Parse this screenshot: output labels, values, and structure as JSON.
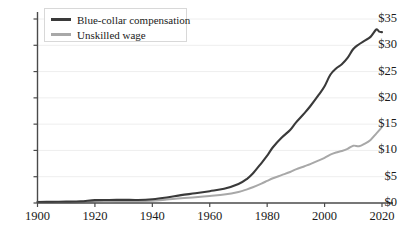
{
  "chart_data": {
    "type": "line",
    "title": "",
    "subtitle": "",
    "xlabel": "",
    "ylabel": "",
    "xlim": [
      1900,
      2020
    ],
    "ylim": [
      0,
      35
    ],
    "grid": true,
    "legend_position": "top-left",
    "x_ticks": [
      "1900",
      "1920",
      "1940",
      "1960",
      "1980",
      "2000",
      "2020"
    ],
    "x_tick_values": [
      1900,
      1920,
      1940,
      1960,
      1980,
      2000,
      2020
    ],
    "y_ticks": [
      "$0",
      "$5",
      "$10",
      "$15",
      "$20",
      "$25",
      "$30",
      "$35"
    ],
    "y_tick_values": [
      0,
      5,
      10,
      15,
      20,
      25,
      30,
      35
    ],
    "x": [
      1900,
      1905,
      1910,
      1915,
      1920,
      1925,
      1930,
      1935,
      1940,
      1945,
      1950,
      1955,
      1960,
      1965,
      1970,
      1973,
      1975,
      1978,
      1980,
      1982,
      1985,
      1988,
      1990,
      1993,
      1995,
      1998,
      2000,
      2002,
      2004,
      2006,
      2008,
      2010,
      2012,
      2014,
      2016,
      2018,
      2019,
      2020
    ],
    "series": [
      {
        "name": "Blue-collar compensation",
        "color": "#3a3a3a",
        "values": [
          0.2,
          0.22,
          0.26,
          0.32,
          0.55,
          0.58,
          0.6,
          0.58,
          0.72,
          1.05,
          1.5,
          1.85,
          2.25,
          2.7,
          3.6,
          4.6,
          5.6,
          7.6,
          9.0,
          10.6,
          12.4,
          13.9,
          15.3,
          17.1,
          18.4,
          20.6,
          22.2,
          24.4,
          25.6,
          26.4,
          27.6,
          29.3,
          30.2,
          30.9,
          31.6,
          33.0,
          32.6,
          32.5
        ]
      },
      {
        "name": "Unskilled wage",
        "color": "#a8a8a8",
        "values": [
          0.12,
          0.13,
          0.15,
          0.2,
          0.35,
          0.36,
          0.34,
          0.32,
          0.42,
          0.65,
          0.9,
          1.1,
          1.35,
          1.6,
          2.1,
          2.6,
          3.0,
          3.7,
          4.2,
          4.7,
          5.3,
          5.9,
          6.4,
          7.0,
          7.4,
          8.1,
          8.6,
          9.2,
          9.6,
          9.9,
          10.3,
          10.9,
          10.8,
          11.3,
          12.0,
          13.2,
          13.8,
          14.5
        ]
      }
    ]
  },
  "legend": {
    "entries": [
      {
        "label": "Blue-collar compensation",
        "color": "#3a3a3a"
      },
      {
        "label": "Unskilled wage",
        "color": "#a8a8a8"
      }
    ]
  },
  "axes": {
    "axis_color": "#4a4a4a",
    "grid_color": "#eeeeee",
    "tick_color": "#4a4a4a"
  },
  "caption": {
    "text": ""
  }
}
